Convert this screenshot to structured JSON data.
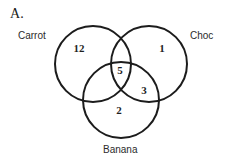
{
  "figure": {
    "label": "A."
  },
  "diagram": {
    "type": "venn-3-set",
    "sets": [
      {
        "id": "carrot",
        "label": "Carrot",
        "position": "top-left"
      },
      {
        "id": "choc",
        "label": "Choc",
        "position": "top-right"
      },
      {
        "id": "banana",
        "label": "Banana",
        "position": "bottom"
      }
    ],
    "regions": [
      {
        "id": "carrot-only",
        "label": "Carrot only",
        "value": "12"
      },
      {
        "id": "choc-only",
        "label": "Choc only",
        "value": "1"
      },
      {
        "id": "all-three",
        "label": "Carrot and Choc and Banana",
        "value": "5"
      },
      {
        "id": "choc-banana",
        "label": "Choc and Banana",
        "value": "3"
      },
      {
        "id": "banana-only",
        "label": "Banana only",
        "value": "2"
      }
    ],
    "colors": {
      "stroke": "#1c1c1c",
      "background": "#ffffff",
      "text": "#1f1f1f"
    }
  }
}
